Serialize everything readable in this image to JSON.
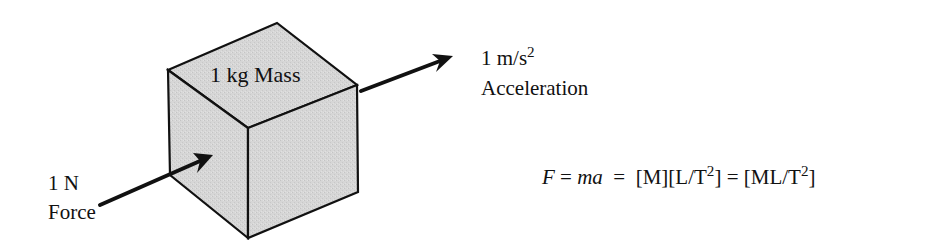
{
  "diagram": {
    "type": "physics-force-diagram",
    "cube": {
      "label": "1 kg Mass",
      "fill": "#d4d4d4",
      "stroke": "#111111"
    },
    "acceleration": {
      "value_base": "1 m/s",
      "value_exponent": "2",
      "name": "Acceleration"
    },
    "force": {
      "value": "1 N",
      "name": "Force"
    },
    "equation": {
      "lhs_var": "F",
      "eq1": " = ",
      "rhs_var": "ma",
      "eq2": "  =  ",
      "dim1": "[M][L/T",
      "dim1_exp": "2",
      "dim1_close": "]",
      "eq3": " = ",
      "dim2": "[ML/T",
      "dim2_exp": "2",
      "dim2_close": "]"
    }
  }
}
